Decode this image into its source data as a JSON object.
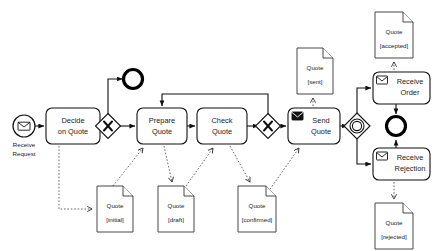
{
  "diagram": {
    "notation": "BPMN",
    "background_color": "#ffffff",
    "line_color": "#111111",
    "association_color": "#555555"
  },
  "events": [
    {
      "id": "start",
      "kind": "message-start-event",
      "icon": "envelope-outline-icon",
      "label_line1": "Receive",
      "label_line2": "Request",
      "x": 24,
      "y": 126
    },
    {
      "id": "end-rejected-early",
      "kind": "end-event",
      "icon": "none",
      "label_line1": "",
      "label_line2": "",
      "x": 133,
      "y": 79
    },
    {
      "id": "end-final",
      "kind": "end-event",
      "icon": "none",
      "label_line1": "",
      "label_line2": "",
      "x": 396,
      "y": 126
    }
  ],
  "gateways": [
    {
      "id": "gw-decide",
      "kind": "exclusive-gateway",
      "symbol": "X",
      "x": 108,
      "y": 126
    },
    {
      "id": "gw-check",
      "kind": "exclusive-gateway",
      "symbol": "X",
      "x": 268,
      "y": 126
    },
    {
      "id": "gw-event",
      "kind": "event-based-gateway",
      "symbol": "circle",
      "x": 357,
      "y": 126
    }
  ],
  "tasks": [
    {
      "id": "decide-on-quote",
      "line1": "Decide",
      "line2": "on Quote",
      "icon": "none",
      "x": 46,
      "y": 108,
      "w": 54,
      "h": 36
    },
    {
      "id": "prepare-quote",
      "line1": "Prepare",
      "line2": "Quote",
      "icon": "none",
      "x": 137,
      "y": 108,
      "w": 50,
      "h": 36
    },
    {
      "id": "check-quote",
      "line1": "Check",
      "line2": "Quote",
      "icon": "none",
      "x": 197,
      "y": 108,
      "w": 50,
      "h": 36
    },
    {
      "id": "send-quote",
      "line1": "Send",
      "line2": "Quote",
      "icon": "envelope-solid-icon",
      "x": 288,
      "y": 108,
      "w": 52,
      "h": 36
    },
    {
      "id": "receive-order",
      "line1": "Receive",
      "line2": "Order",
      "icon": "envelope-outline-icon",
      "x": 373,
      "y": 72,
      "w": 57,
      "h": 32
    },
    {
      "id": "receive-rejection",
      "line1": "Receive",
      "line2": "Rejection",
      "icon": "envelope-outline-icon",
      "x": 373,
      "y": 148,
      "w": 57,
      "h": 32
    }
  ],
  "data_objects": [
    {
      "id": "quote-initial",
      "name": "Quote",
      "state": "[initial]",
      "x": 97,
      "y": 186,
      "w": 36,
      "h": 46
    },
    {
      "id": "quote-draft",
      "name": "Quote",
      "state": "[draft]",
      "x": 158,
      "y": 186,
      "w": 36,
      "h": 46
    },
    {
      "id": "quote-confirmed",
      "name": "Quote",
      "state": "[confirmed]",
      "x": 238,
      "y": 186,
      "w": 38,
      "h": 46
    },
    {
      "id": "quote-sent",
      "name": "Quote",
      "state": "[sent]",
      "x": 297,
      "y": 48,
      "w": 36,
      "h": 46
    },
    {
      "id": "quote-accepted",
      "name": "Quote",
      "state": "[accepted]",
      "x": 375,
      "y": 12,
      "w": 38,
      "h": 46
    },
    {
      "id": "quote-rejected",
      "name": "Quote",
      "state": "[rejected]",
      "x": 375,
      "y": 203,
      "w": 38,
      "h": 46
    }
  ],
  "sequence_flows": [
    {
      "from": "start",
      "to": "decide-on-quote"
    },
    {
      "from": "decide-on-quote",
      "to": "gw-decide"
    },
    {
      "from": "gw-decide",
      "to": "end-rejected-early"
    },
    {
      "from": "gw-decide",
      "to": "prepare-quote"
    },
    {
      "from": "prepare-quote",
      "to": "check-quote"
    },
    {
      "from": "check-quote",
      "to": "gw-check"
    },
    {
      "from": "gw-check",
      "to": "prepare-quote"
    },
    {
      "from": "gw-check",
      "to": "send-quote"
    },
    {
      "from": "send-quote",
      "to": "gw-event"
    },
    {
      "from": "gw-event",
      "to": "receive-order"
    },
    {
      "from": "gw-event",
      "to": "receive-rejection"
    },
    {
      "from": "receive-order",
      "to": "end-final"
    },
    {
      "from": "receive-rejection",
      "to": "end-final"
    }
  ],
  "data_associations": [
    {
      "from": "decide-on-quote",
      "to": "quote-initial"
    },
    {
      "from": "quote-initial",
      "to": "prepare-quote"
    },
    {
      "from": "prepare-quote",
      "to": "quote-draft"
    },
    {
      "from": "quote-draft",
      "to": "check-quote"
    },
    {
      "from": "quote-confirmed",
      "to": "check-quote"
    },
    {
      "from": "quote-confirmed",
      "to": "send-quote"
    },
    {
      "from": "send-quote",
      "to": "quote-sent"
    },
    {
      "from": "receive-order",
      "to": "quote-accepted"
    },
    {
      "from": "receive-rejection",
      "to": "quote-rejected"
    }
  ]
}
